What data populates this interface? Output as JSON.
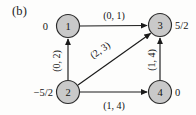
{
  "figure": {
    "caption": "(b)",
    "type": "directed-graph"
  },
  "graph": {
    "nodes": [
      {
        "id": "1",
        "label": "1",
        "potential": "0",
        "potential_side": "left",
        "cx": 68,
        "cy": 26
      },
      {
        "id": "3",
        "label": "3",
        "potential": "5/2",
        "potential_side": "right",
        "cx": 160,
        "cy": 25
      },
      {
        "id": "2",
        "label": "2",
        "potential": "−5/2",
        "potential_side": "left",
        "cx": 68,
        "cy": 92
      },
      {
        "id": "4",
        "label": "4",
        "potential": "0",
        "potential_side": "right",
        "cx": 160,
        "cy": 92
      }
    ],
    "edges": [
      {
        "from": "1",
        "to": "3",
        "label": "(0, 1)",
        "orientation": "horizontal-top"
      },
      {
        "from": "2",
        "to": "1",
        "label": "(0, 2)",
        "orientation": "vertical-left"
      },
      {
        "from": "2",
        "to": "3",
        "label": "(2, 3)",
        "orientation": "diagonal"
      },
      {
        "from": "2",
        "to": "4",
        "label": "(1, 4)",
        "orientation": "horizontal-bottom"
      },
      {
        "from": "4",
        "to": "3",
        "label": "(1, 4)",
        "orientation": "vertical-right"
      }
    ]
  },
  "labels": {
    "edge_top": "(0, 1)",
    "edge_left": "(0, 2)",
    "edge_diagonal": "(2, 3)",
    "edge_bottom": "(1, 4)",
    "edge_right": "(1, 4)",
    "node1_num": "1",
    "node2_num": "2",
    "node3_num": "3",
    "node4_num": "4",
    "node1_potential": "0",
    "node2_potential": "−5/2",
    "node3_potential": "5/2",
    "node4_potential": "0"
  },
  "colors": {
    "node_fill": "#c9c9c9",
    "node_stroke": "#2b2b2b",
    "edge": "#1a1a1a",
    "text": "#141414",
    "background": "#fdfdfc"
  }
}
